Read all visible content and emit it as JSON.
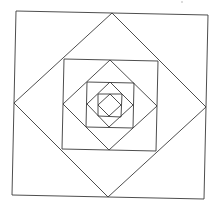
{
  "diagram": {
    "title": "",
    "stroke_color": "#3a3a3a",
    "background": "#ffffff",
    "shapes": [
      {
        "name": "square-1",
        "points": "16,11 208,15 204,199 12,195"
      },
      {
        "name": "diamond-1",
        "points": "112,13 206,107 108,197 14,103"
      },
      {
        "name": "square-2",
        "points": "64,59 158,61 156,151 62,149"
      },
      {
        "name": "diamond-2",
        "points": "110,60 157,106 109,150 63,104"
      },
      {
        "name": "square-3",
        "points": "87,82 134,83 133,128 86,127"
      },
      {
        "name": "diamond-3",
        "points": "110,82 133,105 109,127 87,104"
      },
      {
        "name": "square-4",
        "points": "98,94 122,94 121,117 98,116"
      },
      {
        "name": "diamond-4",
        "points": "110,94 121,105 109,116 98,105"
      }
    ]
  }
}
